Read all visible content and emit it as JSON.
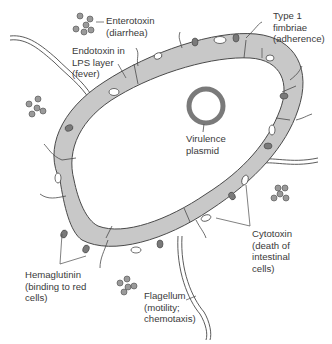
{
  "diagram": {
    "type": "bacterial cell virulence factors",
    "colors": {
      "cell_wall": "#c8c8c8",
      "outline": "#4a4a4a",
      "hemaglutinin": "#7a7a7a",
      "cytotoxin": "#ffffff",
      "toxin_cluster": "#9a9a9a",
      "plasmid": "#7a7a7a",
      "text": "#3a3a3a"
    },
    "labels": {
      "enterotoxin": {
        "line1": "Enterotoxin",
        "line2": "(diarrhea)"
      },
      "endotoxin": {
        "line1": "Endotoxin in",
        "line2": "LPS layer",
        "line3": "(fever)"
      },
      "fimbriae": {
        "line1": "Type 1",
        "line2": "fimbriae",
        "line3": "(adherence)"
      },
      "plasmid": {
        "line1": "Virulence",
        "line2": "plasmid"
      },
      "cytotoxin": {
        "line1": "Cytotoxin",
        "line2": "(death of",
        "line3": "intestinal",
        "line4": "cells)"
      },
      "hemaglutinin": {
        "line1": "Hemaglutinin",
        "line2": "(binding to red",
        "line3": "cells)"
      },
      "flagellum": {
        "line1": "Flagellum",
        "line2": "(motility;",
        "line3": "chemotaxis)"
      }
    }
  }
}
